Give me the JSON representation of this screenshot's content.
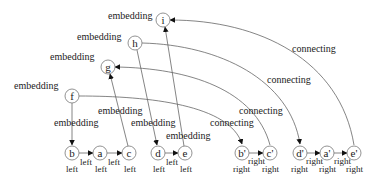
{
  "diagram": {
    "nodes": {
      "i": {
        "label": "i"
      },
      "h": {
        "label": "h"
      },
      "g": {
        "label": "g"
      },
      "f": {
        "label": "f"
      },
      "b": {
        "label": "b",
        "sublabel": "left"
      },
      "a": {
        "label": "a",
        "sublabel": "left"
      },
      "c": {
        "label": "c",
        "sublabel": "left"
      },
      "d": {
        "label": "d",
        "sublabel": "left"
      },
      "e": {
        "label": "e",
        "sublabel": "left"
      },
      "b2": {
        "label": "b'",
        "sublabel": "right"
      },
      "c2": {
        "label": "c'",
        "sublabel": "right"
      },
      "d2": {
        "label": "d'",
        "sublabel": "right"
      },
      "a2": {
        "label": "a'",
        "sublabel": "right"
      },
      "e2": {
        "label": "e'",
        "sublabel": "right"
      }
    },
    "edge_labels": {
      "i_embedding": "embedding",
      "h_embedding": "embedding",
      "g_embedding": "embedding",
      "f_embedding": "embedding",
      "f_b_embedding": "embedding",
      "c_g_embedding": "embedding",
      "h_d_embedding": "embedding",
      "e_i_embedding": "embedding",
      "b_a_left": "left",
      "a_c_left": "left",
      "d_e_left": "left",
      "b2_c2_right": "right",
      "d2_a2_right": "right",
      "a2_e2_right": "right",
      "e2_i_connecting": "connecting",
      "h_d2_connecting": "connecting",
      "c2_g_connecting": "connecting",
      "f_b2_connecting": "connecting"
    }
  }
}
